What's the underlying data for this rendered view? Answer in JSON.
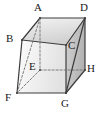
{
  "figure": {
    "kind": "geometry-diagram",
    "shape_name": "cube",
    "width": 104,
    "height": 113,
    "background_color": "#ffffff"
  },
  "colors": {
    "edge_solid": "#3c3c3c",
    "edge_hidden": "#707070",
    "label_text": "#1a1a1a",
    "face_top_light": "#f2f2f2",
    "face_top_dark": "#d2d2d2",
    "face_front_light": "#fbfbfb",
    "face_front_dark": "#e4e4e4",
    "face_right_light": "#cfcfcf",
    "face_right_dark": "#b4b4b4",
    "face_cut_light": "#dcdcdc",
    "face_cut_dark": "#c4c4c4"
  },
  "vertices": [
    {
      "id": "A",
      "label": "A",
      "x": 40,
      "y": 18,
      "label_x": 34,
      "label_y": 2,
      "hidden": false
    },
    {
      "id": "B",
      "label": "B",
      "x": 22,
      "y": 40,
      "label_x": 6,
      "label_y": 33,
      "hidden": false
    },
    {
      "id": "C",
      "label": "C",
      "x": 66,
      "y": 45,
      "label_x": 68,
      "label_y": 40,
      "hidden": false
    },
    {
      "id": "D",
      "label": "D",
      "x": 85,
      "y": 18,
      "label_x": 80,
      "label_y": 2,
      "hidden": false
    },
    {
      "id": "E",
      "label": "E",
      "x": 40,
      "y": 70,
      "label_x": 29,
      "label_y": 61,
      "hidden": true
    },
    {
      "id": "F",
      "label": "F",
      "x": 17,
      "y": 93,
      "label_x": 5,
      "label_y": 92,
      "hidden": false
    },
    {
      "id": "G",
      "label": "G",
      "x": 66,
      "y": 93,
      "label_x": 61,
      "label_y": 98,
      "hidden": false
    },
    {
      "id": "H",
      "label": "H",
      "x": 85,
      "y": 70,
      "label_x": 87,
      "label_y": 63,
      "hidden": false
    }
  ],
  "edges": [
    {
      "from": "A",
      "to": "B",
      "style": "solid",
      "name": "edge-ab"
    },
    {
      "from": "A",
      "to": "D",
      "style": "solid",
      "name": "edge-ad"
    },
    {
      "from": "B",
      "to": "C",
      "style": "solid",
      "name": "edge-bc"
    },
    {
      "from": "C",
      "to": "D",
      "style": "solid",
      "name": "edge-cd"
    },
    {
      "from": "B",
      "to": "F",
      "style": "solid",
      "name": "edge-bf"
    },
    {
      "from": "C",
      "to": "G",
      "style": "solid",
      "name": "edge-cg"
    },
    {
      "from": "D",
      "to": "H",
      "style": "solid",
      "name": "edge-dh"
    },
    {
      "from": "F",
      "to": "G",
      "style": "solid",
      "name": "edge-fg"
    },
    {
      "from": "G",
      "to": "H",
      "style": "solid",
      "name": "edge-gh"
    },
    {
      "from": "A",
      "to": "E",
      "style": "dashed",
      "name": "edge-ae"
    },
    {
      "from": "E",
      "to": "F",
      "style": "dashed",
      "name": "edge-ef"
    },
    {
      "from": "E",
      "to": "H",
      "style": "dashed",
      "name": "edge-eh"
    },
    {
      "from": "A",
      "to": "F",
      "style": "dashed",
      "name": "diagonal-af"
    },
    {
      "from": "D",
      "to": "G",
      "style": "solid",
      "name": "diagonal-dg"
    }
  ],
  "faces": [
    {
      "name": "face-top-abcd",
      "vertices": [
        "A",
        "B",
        "C",
        "D"
      ],
      "fill": "top"
    },
    {
      "name": "face-front-bcgf",
      "vertices": [
        "B",
        "C",
        "G",
        "F"
      ],
      "fill": "front"
    },
    {
      "name": "face-right-cdhg",
      "vertices": [
        "C",
        "D",
        "H",
        "G"
      ],
      "fill": "right"
    }
  ]
}
